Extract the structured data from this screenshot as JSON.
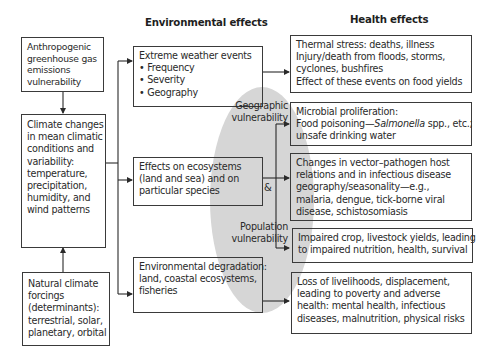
{
  "headers": {
    "environmental": "Environmental effects",
    "health": "Health effects"
  },
  "drivers": {
    "anthropogenic": [
      "Anthropogenic",
      "greenhouse gas",
      "emissions",
      "vulnerability"
    ],
    "climate_changes": [
      "Climate changes",
      "in mean climatic",
      "conditions and",
      "variability:",
      "temperature,",
      "precipitation,",
      "humidity, and",
      "wind patterns"
    ],
    "natural": [
      "Natural climate",
      "forcings",
      "(determinants):",
      "terrestrial, solar,",
      "planetary, orbital"
    ]
  },
  "environmental_effects": {
    "extreme_weather": {
      "title": "Extreme weather events",
      "bullets": [
        "Frequency",
        "Severity",
        "Geography"
      ]
    },
    "ecosystems": [
      "Effects on ecosystems",
      "(land and sea) and on",
      "particular species"
    ],
    "degradation": [
      "Environmental degradation:",
      "land, coastal ecosystems,",
      "fisheries"
    ]
  },
  "modifiers": {
    "geographic": [
      "Geographic",
      "vulnerability"
    ],
    "ampersand": "&",
    "population": [
      "Population",
      "vulnerability"
    ]
  },
  "health_effects": {
    "thermal": [
      "Thermal stress: deaths, illness",
      "Injury/death from floods, storms,",
      "cyclones, bushfires",
      "Effect of these events on food yields"
    ],
    "microbial": {
      "line1": "Microbial proliferation:",
      "line2_pre": "Food poisoning—",
      "line2_italic": "Salmonella",
      "line2_post": " spp., etc.;",
      "line3": "unsafe drinking water"
    },
    "vector": [
      "Changes in vector–pathogen host",
      "relations and in infectious disease",
      "geography/seasonality—e.g.,",
      "malaria, dengue, tick-borne viral",
      "disease, schistosomiasis"
    ],
    "crop": [
      "Impaired crop, livestock yields, leading",
      "to impaired nutrition, health, survival"
    ],
    "livelihoods": [
      "Loss of livelihoods, displacement,",
      "leading to poverty and adverse",
      "health: mental health, infectious",
      "diseases, malnutrition, physical risks"
    ]
  },
  "colors": {
    "ellipse": "#d4d4d4",
    "stroke": "#3a3a3a",
    "text": "#2a2a2a"
  }
}
